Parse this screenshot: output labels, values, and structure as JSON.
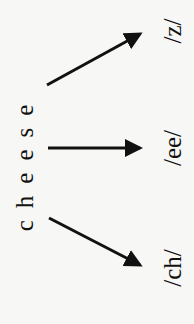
{
  "word": "cheese",
  "phonemes": [
    {
      "id": "z",
      "label": "/z/"
    },
    {
      "id": "ee",
      "label": "/ee/"
    },
    {
      "id": "ch",
      "label": "/ch/"
    }
  ],
  "colors": {
    "ink": "#111111",
    "background": "#f7f7f5"
  }
}
